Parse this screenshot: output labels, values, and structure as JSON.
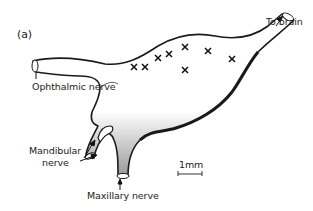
{
  "figure": {
    "panel_label": "(a)",
    "labels": {
      "to_brain": "To brain",
      "ophthalmic": "Ophthalmic nerve",
      "mandibular_line1": "Mandibular",
      "mandibular_line2": "nerve",
      "maxillary": "Maxillary nerve",
      "scale": "1mm"
    },
    "markers": [
      {
        "x": 134,
        "y": 67
      },
      {
        "x": 145,
        "y": 67
      },
      {
        "x": 158,
        "y": 58
      },
      {
        "x": 169,
        "y": 54
      },
      {
        "x": 185,
        "y": 47
      },
      {
        "x": 208,
        "y": 51
      },
      {
        "x": 232,
        "y": 59
      },
      {
        "x": 185,
        "y": 70
      }
    ],
    "colors": {
      "ink": "#1a1a1a",
      "shade": "#555555",
      "background": "#ffffff"
    }
  }
}
